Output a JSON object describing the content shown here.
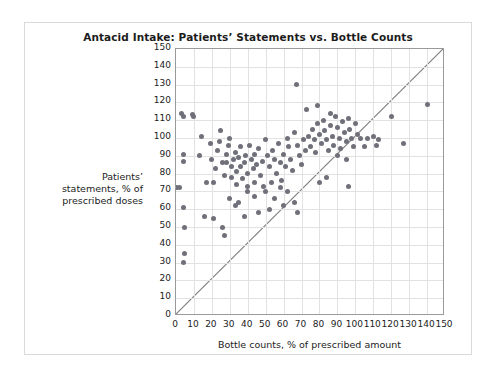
{
  "chart_data": {
    "type": "scatter",
    "title": "Antacid Intake: Patients’ Statements vs. Bottle Counts",
    "xlabel": "Bottle counts, % of prescribed amount",
    "ylabel": "Patients’ statements, % of prescribed doses",
    "xlim": [
      0,
      150
    ],
    "ylim": [
      0,
      150
    ],
    "xticks": [
      0,
      10,
      20,
      30,
      40,
      50,
      60,
      70,
      80,
      90,
      100,
      110,
      120,
      130,
      140,
      150
    ],
    "yticks": [
      0,
      10,
      20,
      30,
      40,
      50,
      60,
      70,
      80,
      90,
      100,
      110,
      120,
      130,
      140,
      150
    ],
    "grid": true,
    "legend": "none",
    "annotations": [
      {
        "name": "identity-line",
        "type": "line",
        "from": [
          0,
          0
        ],
        "to": [
          150,
          150
        ]
      }
    ],
    "marker": {
      "shape": "circle",
      "color": "#70707a",
      "size": 5
    },
    "points": [
      [
        3,
        114
      ],
      [
        4,
        112
      ],
      [
        4,
        91
      ],
      [
        4,
        87
      ],
      [
        2,
        72
      ],
      [
        0,
        72
      ],
      [
        4,
        61
      ],
      [
        5,
        50
      ],
      [
        5,
        35
      ],
      [
        4,
        30
      ],
      [
        9,
        113
      ],
      [
        10,
        112
      ],
      [
        16,
        56
      ],
      [
        21,
        55
      ],
      [
        26,
        50
      ],
      [
        27,
        45
      ],
      [
        13,
        90
      ],
      [
        14,
        101
      ],
      [
        17,
        75
      ],
      [
        21,
        75
      ],
      [
        19,
        97
      ],
      [
        20,
        88
      ],
      [
        22,
        83
      ],
      [
        23,
        93
      ],
      [
        24,
        98
      ],
      [
        25,
        104
      ],
      [
        26,
        86
      ],
      [
        27,
        79
      ],
      [
        28,
        91
      ],
      [
        28,
        86
      ],
      [
        29,
        96
      ],
      [
        30,
        100
      ],
      [
        31,
        84
      ],
      [
        31,
        78
      ],
      [
        32,
        88
      ],
      [
        33,
        92
      ],
      [
        34,
        81
      ],
      [
        34,
        74
      ],
      [
        35,
        89
      ],
      [
        36,
        95
      ],
      [
        36,
        84
      ],
      [
        37,
        77
      ],
      [
        38,
        86
      ],
      [
        39,
        90
      ],
      [
        40,
        73
      ],
      [
        40,
        80
      ],
      [
        41,
        96
      ],
      [
        42,
        88
      ],
      [
        43,
        83
      ],
      [
        44,
        91
      ],
      [
        44,
        75
      ],
      [
        45,
        85
      ],
      [
        46,
        94
      ],
      [
        47,
        79
      ],
      [
        48,
        87
      ],
      [
        49,
        73
      ],
      [
        50,
        99
      ],
      [
        51,
        90
      ],
      [
        52,
        84
      ],
      [
        53,
        75
      ],
      [
        54,
        93
      ],
      [
        55,
        88
      ],
      [
        56,
        80
      ],
      [
        57,
        97
      ],
      [
        58,
        86
      ],
      [
        59,
        76
      ],
      [
        60,
        91
      ],
      [
        61,
        84
      ],
      [
        62,
        100
      ],
      [
        63,
        95
      ],
      [
        64,
        88
      ],
      [
        65,
        82
      ],
      [
        66,
        103
      ],
      [
        67,
        130
      ],
      [
        68,
        96
      ],
      [
        69,
        90
      ],
      [
        70,
        85
      ],
      [
        71,
        99
      ],
      [
        72,
        93
      ],
      [
        30,
        66
      ],
      [
        35,
        64
      ],
      [
        40,
        70
      ],
      [
        44,
        67
      ],
      [
        50,
        70
      ],
      [
        55,
        66
      ],
      [
        58,
        72
      ],
      [
        62,
        70
      ],
      [
        33,
        62
      ],
      [
        38,
        56
      ],
      [
        46,
        58
      ],
      [
        52,
        60
      ],
      [
        60,
        62
      ],
      [
        66,
        64
      ],
      [
        74,
        101
      ],
      [
        75,
        95
      ],
      [
        76,
        105
      ],
      [
        77,
        99
      ],
      [
        78,
        92
      ],
      [
        79,
        108
      ],
      [
        80,
        102
      ],
      [
        81,
        97
      ],
      [
        82,
        110
      ],
      [
        83,
        104
      ],
      [
        84,
        99
      ],
      [
        85,
        93
      ],
      [
        86,
        107
      ],
      [
        87,
        101
      ],
      [
        88,
        96
      ],
      [
        89,
        112
      ],
      [
        90,
        106
      ],
      [
        91,
        100
      ],
      [
        92,
        94
      ],
      [
        93,
        109
      ],
      [
        94,
        103
      ],
      [
        95,
        98
      ],
      [
        96,
        111
      ],
      [
        97,
        105
      ],
      [
        98,
        100
      ],
      [
        99,
        95
      ],
      [
        100,
        108
      ],
      [
        101,
        102
      ],
      [
        73,
        116
      ],
      [
        79,
        118
      ],
      [
        86,
        114
      ],
      [
        90,
        90
      ],
      [
        95,
        88
      ],
      [
        96,
        73
      ],
      [
        103,
        100
      ],
      [
        107,
        100
      ],
      [
        110,
        101
      ],
      [
        113,
        99
      ],
      [
        105,
        95
      ],
      [
        112,
        96
      ],
      [
        120,
        112
      ],
      [
        127,
        97
      ],
      [
        140,
        119
      ],
      [
        68,
        58
      ],
      [
        80,
        75
      ],
      [
        84,
        78
      ]
    ]
  },
  "axes": {
    "y_caption_lines": [
      "Patients’",
      "statements, % of",
      "prescribed doses"
    ]
  }
}
